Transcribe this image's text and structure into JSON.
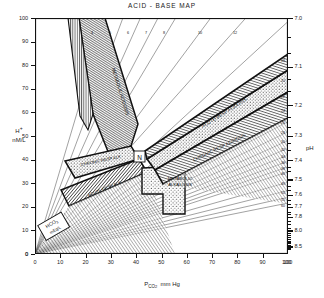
{
  "title": "ACID - BASE MAP",
  "axes": {
    "y_left_label_main": "H",
    "y_left_label_sup": "+",
    "y_left_label_units": "nM/L",
    "y_right_label": "pH",
    "x_label_main": "P",
    "x_label_sub": "CO",
    "x_label_sub2": "2",
    "x_label_units": "mm Hg",
    "y_ticks": [
      0,
      10,
      20,
      30,
      40,
      50,
      60,
      70,
      80,
      90,
      100
    ],
    "x_ticks": [
      0,
      10,
      20,
      30,
      40,
      50,
      60,
      70,
      80,
      90,
      100
    ],
    "ph_ticks": [
      {
        "label": "7.0",
        "h": 100
      },
      {
        "label": "7.1",
        "h": 79.4
      },
      {
        "label": "7.2",
        "h": 63.1
      },
      {
        "label": "7.3",
        "h": 50.1
      },
      {
        "label": "7.4",
        "h": 39.8
      },
      {
        "label": "7.5",
        "h": 31.6
      },
      {
        "label": "7.6",
        "h": 25.1
      },
      {
        "label": "7.7",
        "h": 20.0
      },
      {
        "label": "7.8",
        "h": 15.8
      },
      {
        "label": "8.0",
        "h": 10.0
      },
      {
        "label": "8.5",
        "h": 3.2
      }
    ],
    "ph_minor": [
      92,
      85,
      74,
      69,
      58,
      54,
      47,
      44,
      37,
      35,
      29,
      27,
      23,
      21,
      18,
      17,
      14,
      12.6,
      11.2,
      8.9,
      7.9,
      7.1,
      6.3,
      5.6,
      5.0,
      4.5,
      4.0,
      2.8,
      2.5,
      2.2
    ]
  },
  "regions": [
    {
      "name": "acute-metabolic-acidosis",
      "label": "",
      "pattern": "vertical"
    },
    {
      "name": "metabolic-acidosis",
      "label": "METABOLIC ACIDOSIS",
      "pattern": "vertical"
    },
    {
      "name": "chronic-resp-alkalosis",
      "label": "CHRONIC RESP ALK",
      "pattern": "diagonal"
    },
    {
      "name": "acute-resp-alkalosis",
      "label": "ACUTE RESP ALK",
      "pattern": "diagonal"
    },
    {
      "name": "metabolic-alkalosis",
      "label": "METABOLIC ALKALOSIS",
      "pattern": "dots"
    },
    {
      "name": "acute-resp-acidosis",
      "label": "ACUTE RESP ACIDOSIS",
      "pattern": "dots"
    },
    {
      "name": "chronic-resp-acidosis",
      "label": "CHRONIC RESP ACIDOSIS",
      "pattern": "horizontal"
    }
  ],
  "normal_marker": "N",
  "isopleth_legend_main": "HCO",
  "isopleth_legend_sub": "3",
  "isopleth_legend_units": "mEq/L",
  "chart_data": {
    "type": "line",
    "title": "ACID - BASE MAP",
    "xlabel": "PCO2 mm Hg",
    "ylabel": "H+ nM/L",
    "y2label": "pH",
    "xlim": [
      0,
      100
    ],
    "ylim": [
      0,
      100
    ],
    "grid": false,
    "legend": "none",
    "note": "Henderson-Hasselbalch nomogram. Isopleths are lines of constant bicarbonate: H+ = 24 * PCO2 / HCO3.",
    "isopleths_hco3": [
      4,
      5,
      6,
      7,
      8,
      10,
      12,
      15,
      18,
      20,
      22,
      24,
      26,
      28,
      30,
      32,
      34,
      36,
      38,
      40,
      45,
      50,
      55,
      60
    ],
    "isopleth_tick_labels_top": [
      "4",
      "5",
      "6",
      "7",
      "8",
      "10",
      "12",
      "15"
    ],
    "isopleth_tick_labels_right": [
      "18",
      "20",
      "22",
      "24",
      "26",
      "28",
      "30",
      "32",
      "34",
      "36",
      "38",
      "40",
      "45",
      "50",
      "55",
      "60"
    ],
    "normal_point": {
      "pco2": 40,
      "h": 40,
      "ph": 7.4,
      "hco3": 24
    },
    "bands": [
      {
        "name": "METABOLIC ACIDOSIS",
        "hco3_low": 4,
        "hco3_high": 15,
        "pco2_range": [
          10,
          40
        ]
      },
      {
        "name": "ACUTE RESP ALKALOSIS",
        "hco3_low": 18,
        "hco3_high": 24,
        "pco2_range": [
          12,
          40
        ]
      },
      {
        "name": "CHRONIC RESP ALKALOSIS",
        "hco3_low": 12,
        "hco3_high": 20,
        "pco2_range": [
          12,
          40
        ]
      },
      {
        "name": "METABOLIC ALKALOSIS",
        "hco3_low": 28,
        "hco3_high": 45,
        "pco2_range": [
          40,
          60
        ]
      },
      {
        "name": "ACUTE RESP ACIDOSIS",
        "hco3_low": 24,
        "hco3_high": 30,
        "pco2_range": [
          40,
          100
        ]
      },
      {
        "name": "CHRONIC RESP ACIDOSIS",
        "hco3_low": 30,
        "hco3_high": 45,
        "pco2_range": [
          40,
          100
        ]
      }
    ]
  }
}
